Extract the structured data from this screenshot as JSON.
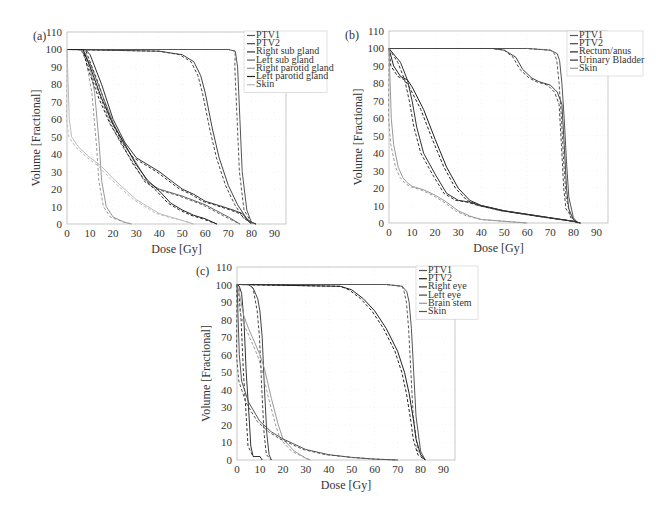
{
  "chart_data": [
    {
      "panel": "(a)",
      "type": "line",
      "title": "",
      "xlabel": "Dose [Gy]",
      "ylabel": "Volume [Fractional]",
      "xlim": [
        0,
        95
      ],
      "ylim": [
        0,
        110
      ],
      "xticks": [
        0,
        10,
        20,
        30,
        40,
        50,
        60,
        70,
        80,
        90
      ],
      "yticks": [
        0,
        10,
        20,
        30,
        40,
        50,
        60,
        70,
        80,
        90,
        100,
        110
      ],
      "grid": true,
      "legend_position": "upper right",
      "line_styles": "solid and dashed pairs per structure",
      "series": [
        {
          "name": "PTV1",
          "color": "#555555",
          "x": [
            0,
            70,
            73,
            74,
            75,
            76,
            78,
            80,
            82
          ],
          "y": [
            100,
            100,
            99,
            90,
            60,
            30,
            8,
            1,
            0
          ]
        },
        {
          "name": "PTV2",
          "color": "#444444",
          "x": [
            0,
            40,
            50,
            55,
            58,
            60,
            63,
            66,
            70,
            74,
            78,
            80,
            82
          ],
          "y": [
            100,
            99,
            97,
            93,
            85,
            75,
            55,
            38,
            22,
            11,
            3,
            1,
            0
          ]
        },
        {
          "name": "Right sub gland",
          "color": "#333333",
          "x": [
            0,
            8,
            10,
            15,
            20,
            25,
            30,
            40,
            45,
            50,
            55,
            60,
            65,
            72,
            76,
            80
          ],
          "y": [
            100,
            100,
            97,
            80,
            60,
            47,
            38,
            30,
            25,
            20,
            17,
            13,
            11,
            8,
            6,
            0
          ]
        },
        {
          "name": "Left sub gland",
          "color": "#666666",
          "x": [
            0,
            6,
            10,
            15,
            20,
            25,
            30,
            35,
            40,
            50,
            60,
            70,
            75
          ],
          "y": [
            100,
            100,
            92,
            75,
            58,
            45,
            35,
            24,
            20,
            16,
            11,
            4,
            0
          ]
        },
        {
          "name": "Right parotid gland",
          "color": "#999999",
          "x": [
            0,
            5,
            8,
            10,
            12,
            14,
            15,
            17,
            20,
            25,
            28
          ],
          "y": [
            100,
            100,
            98,
            90,
            75,
            45,
            25,
            10,
            4,
            1,
            0
          ]
        },
        {
          "name": "Left parotid gland",
          "color": "#222222",
          "x": [
            0,
            7,
            10,
            15,
            20,
            25,
            30,
            35,
            40,
            45,
            50,
            55,
            60,
            65
          ],
          "y": [
            100,
            100,
            90,
            72,
            57,
            46,
            34,
            25,
            19,
            12,
            8,
            5,
            3,
            0
          ]
        },
        {
          "name": "Skin",
          "color": "#bbbbbb",
          "x": [
            0,
            1,
            2,
            5,
            10,
            15,
            20,
            25,
            30,
            35,
            40,
            45,
            50,
            55
          ],
          "y": [
            100,
            60,
            50,
            44,
            38,
            33,
            26,
            20,
            14,
            10,
            6,
            4,
            2,
            0
          ]
        }
      ]
    },
    {
      "panel": "(b)",
      "type": "line",
      "title": "",
      "xlabel": "Dose [Gy]",
      "ylabel": "Volume [Fractional]",
      "xlim": [
        0,
        95
      ],
      "ylim": [
        0,
        110
      ],
      "xticks": [
        0,
        10,
        20,
        30,
        40,
        50,
        60,
        70,
        80,
        90
      ],
      "yticks": [
        0,
        10,
        20,
        30,
        40,
        50,
        60,
        70,
        80,
        90,
        100,
        110
      ],
      "grid": true,
      "legend_position": "upper right",
      "line_styles": "solid and dashed pairs per structure",
      "series": [
        {
          "name": "PTV1",
          "color": "#555555",
          "x": [
            0,
            60,
            70,
            73,
            74,
            75,
            76,
            77,
            78,
            80,
            82
          ],
          "y": [
            100,
            100,
            99,
            97,
            93,
            80,
            60,
            35,
            15,
            3,
            0
          ]
        },
        {
          "name": "PTV2",
          "color": "#444444",
          "x": [
            0,
            45,
            50,
            55,
            58,
            62,
            65,
            70,
            73,
            75,
            76,
            77,
            78,
            80,
            82
          ],
          "y": [
            100,
            100,
            99,
            95,
            88,
            83,
            81,
            79,
            75,
            68,
            45,
            20,
            8,
            2,
            0
          ]
        },
        {
          "name": "Rectum/anus",
          "color": "#222222",
          "x": [
            0,
            2,
            5,
            8,
            10,
            15,
            20,
            25,
            30,
            35,
            40,
            50,
            60,
            70,
            80,
            83
          ],
          "y": [
            100,
            90,
            84,
            82,
            78,
            65,
            48,
            32,
            20,
            13,
            10,
            7,
            5,
            3,
            1,
            0
          ]
        },
        {
          "name": "Urinary Bladder",
          "color": "#333333",
          "x": [
            0,
            5,
            8,
            10,
            12,
            15,
            20,
            25,
            30,
            35,
            40,
            50,
            60,
            70,
            80,
            83
          ],
          "y": [
            100,
            92,
            82,
            70,
            55,
            40,
            28,
            17,
            13,
            12,
            10,
            7,
            5,
            3,
            1,
            0
          ]
        },
        {
          "name": "Skin",
          "color": "#999999",
          "x": [
            0,
            1,
            2,
            4,
            6,
            8,
            10,
            15,
            20,
            25,
            30,
            35,
            40,
            50,
            60
          ],
          "y": [
            100,
            60,
            45,
            32,
            26,
            23,
            21,
            19,
            16,
            12,
            7,
            4,
            2,
            1,
            0
          ]
        }
      ]
    },
    {
      "panel": "(c)",
      "type": "line",
      "title": "",
      "xlabel": "Dose [Gy]",
      "ylabel": "Volume [Fractional]",
      "xlim": [
        0,
        95
      ],
      "ylim": [
        0,
        110
      ],
      "xticks": [
        0,
        10,
        20,
        30,
        40,
        50,
        60,
        70,
        80,
        90
      ],
      "yticks": [
        0,
        10,
        20,
        30,
        40,
        50,
        60,
        70,
        80,
        90,
        100,
        110
      ],
      "grid": true,
      "legend_position": "upper right",
      "line_styles": "solid and dashed pairs per structure",
      "series": [
        {
          "name": "PTV1",
          "color": "#555555",
          "x": [
            0,
            65,
            72,
            74,
            75,
            76,
            77,
            78,
            80,
            82
          ],
          "y": [
            100,
            100,
            99,
            96,
            90,
            75,
            50,
            25,
            5,
            0
          ]
        },
        {
          "name": "PTV2",
          "color": "#222222",
          "x": [
            0,
            45,
            50,
            55,
            60,
            65,
            70,
            73,
            75,
            77,
            78,
            80,
            82
          ],
          "y": [
            100,
            99,
            97,
            92,
            85,
            75,
            62,
            50,
            38,
            22,
            12,
            3,
            0
          ]
        },
        {
          "name": "Right eye",
          "color": "#333333",
          "x": [
            0,
            1,
            2,
            3,
            4,
            5,
            6,
            7,
            10,
            11
          ],
          "y": [
            100,
            99,
            95,
            80,
            50,
            30,
            8,
            2,
            2,
            0
          ]
        },
        {
          "name": "Left eye",
          "color": "#444444",
          "x": [
            0,
            5,
            7,
            9,
            10,
            11,
            12,
            13,
            14,
            15
          ],
          "y": [
            100,
            100,
            98,
            92,
            85,
            70,
            40,
            15,
            3,
            0
          ]
        },
        {
          "name": "Brain stem",
          "color": "#999999",
          "x": [
            0,
            1,
            3,
            5,
            8,
            10,
            12,
            15,
            18,
            20,
            25,
            30,
            32
          ],
          "y": [
            100,
            95,
            82,
            75,
            66,
            60,
            52,
            35,
            20,
            12,
            5,
            1,
            0
          ]
        },
        {
          "name": "Skin",
          "color": "#555555",
          "x": [
            0,
            1,
            2,
            5,
            10,
            15,
            20,
            25,
            30,
            40,
            50,
            60,
            70
          ],
          "y": [
            100,
            60,
            45,
            33,
            22,
            16,
            12,
            9,
            6,
            3,
            1.5,
            0.5,
            0
          ]
        }
      ]
    }
  ],
  "panels": [
    {
      "label": "(a)",
      "legend": [
        "PTV1",
        "PTV2",
        "Right sub gland",
        "Left sub gland",
        "Right parotid gland",
        "Left parotid gland",
        "Skin"
      ]
    },
    {
      "label": "(b)",
      "legend": [
        "PTV1",
        "PTV2",
        "Rectum/anus",
        "Urinary Bladder",
        "Skin"
      ]
    },
    {
      "label": "(c)",
      "legend": [
        "PTV1",
        "PTV2",
        "Right eye",
        "Left eye",
        "Brain stem",
        "Skin"
      ]
    }
  ],
  "axes": {
    "xlabel": "Dose [Gy]",
    "ylabel": "Volume [Fractional]"
  }
}
